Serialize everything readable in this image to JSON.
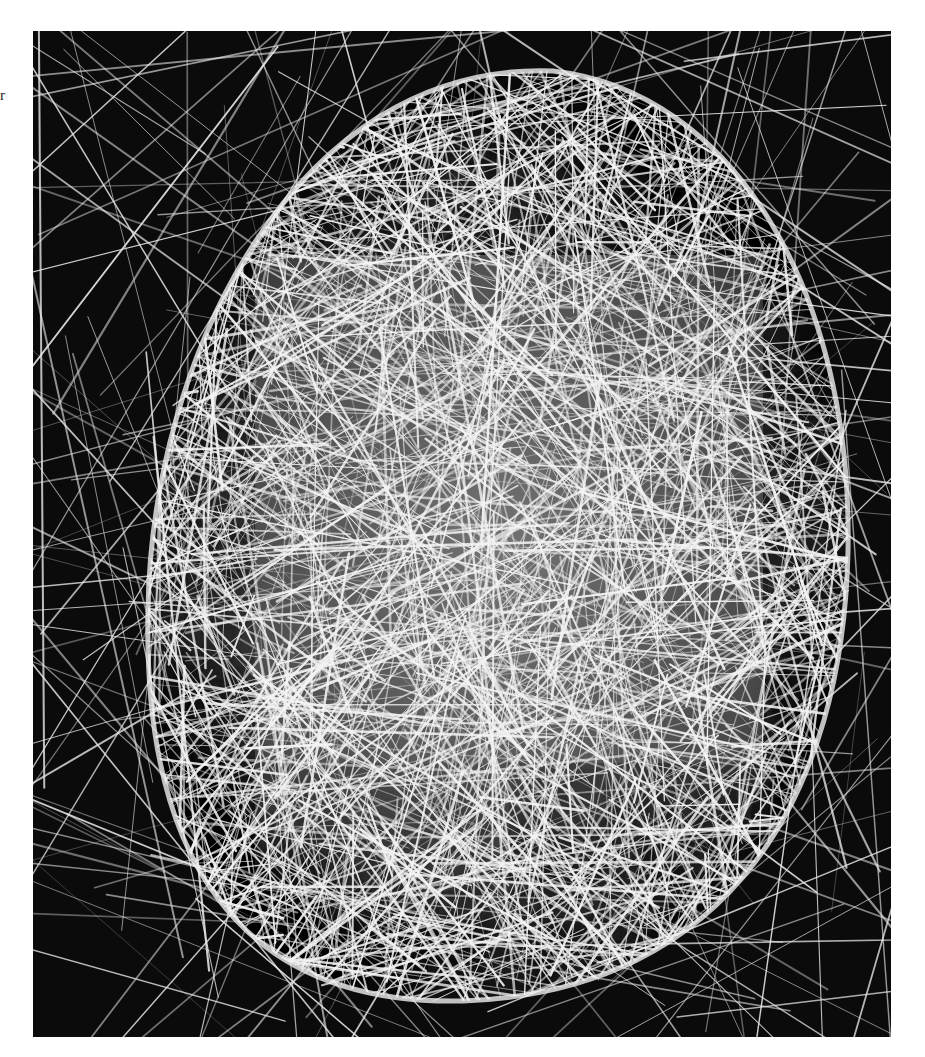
{
  "page": {
    "margin_text_fragment": "r"
  },
  "photo": {
    "subject": "silk cocoon suspended in a web of fibers",
    "style": "black-and-white photograph",
    "colors": {
      "background": "#0b0b0b",
      "fiber": "#f2f2f2",
      "cocoon_core": "#d8d8d8"
    }
  }
}
